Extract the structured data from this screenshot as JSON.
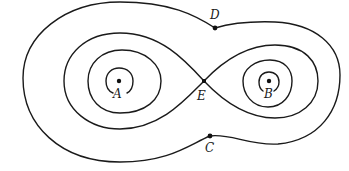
{
  "diagram": {
    "type": "contour-lines",
    "points": [
      {
        "id": "A",
        "label": "A",
        "x": 119,
        "y": 81
      },
      {
        "id": "B",
        "label": "B",
        "x": 269,
        "y": 81
      },
      {
        "id": "C",
        "label": "C",
        "x": 210,
        "y": 136
      },
      {
        "id": "D",
        "label": "D",
        "x": 215,
        "y": 28
      },
      {
        "id": "E",
        "label": "E",
        "x": 204,
        "y": 81
      }
    ],
    "contours": [
      {
        "name": "outer-contour",
        "through": [
          "C",
          "D"
        ]
      },
      {
        "name": "figure-eight-separatrix",
        "through": [
          "E"
        ]
      },
      {
        "name": "contour-around-A-medium"
      },
      {
        "name": "contour-around-A-small"
      },
      {
        "name": "contour-around-B-medium"
      },
      {
        "name": "contour-around-B-small"
      }
    ],
    "colors": {
      "stroke": "#1a1a1a",
      "background": "#ffffff"
    }
  }
}
